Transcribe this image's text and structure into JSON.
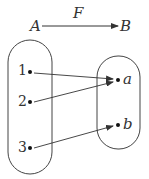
{
  "diagram": {
    "title_arrow": {
      "from": "A",
      "to": "B",
      "label": "F"
    },
    "domain_set": {
      "name": "A",
      "elements": [
        "1",
        "2",
        "3"
      ]
    },
    "codomain_set": {
      "name": "B",
      "elements": [
        "a",
        "b"
      ]
    },
    "mappings": [
      {
        "from": "1",
        "to": "a"
      },
      {
        "from": "2",
        "to": "a"
      },
      {
        "from": "3",
        "to": "b"
      }
    ],
    "colors": {
      "stroke": "#333333",
      "background": "#ffffff"
    }
  }
}
